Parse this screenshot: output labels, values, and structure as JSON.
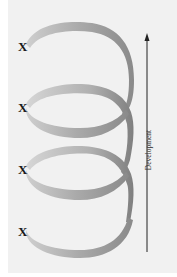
{
  "diagram": {
    "type": "spiral",
    "markers": [
      {
        "label": "X",
        "top": 40
      },
      {
        "label": "X",
        "top": 101
      },
      {
        "label": "X",
        "top": 163
      },
      {
        "label": "X",
        "top": 225
      }
    ],
    "axis": {
      "label": "Development",
      "direction": "up"
    },
    "colors": {
      "background": "#f1f1f1",
      "ribbon_light": "#c8c8c8",
      "ribbon_dark": "#8a8a8a",
      "arrow": "#222222",
      "text": "#1a1a1a"
    }
  }
}
